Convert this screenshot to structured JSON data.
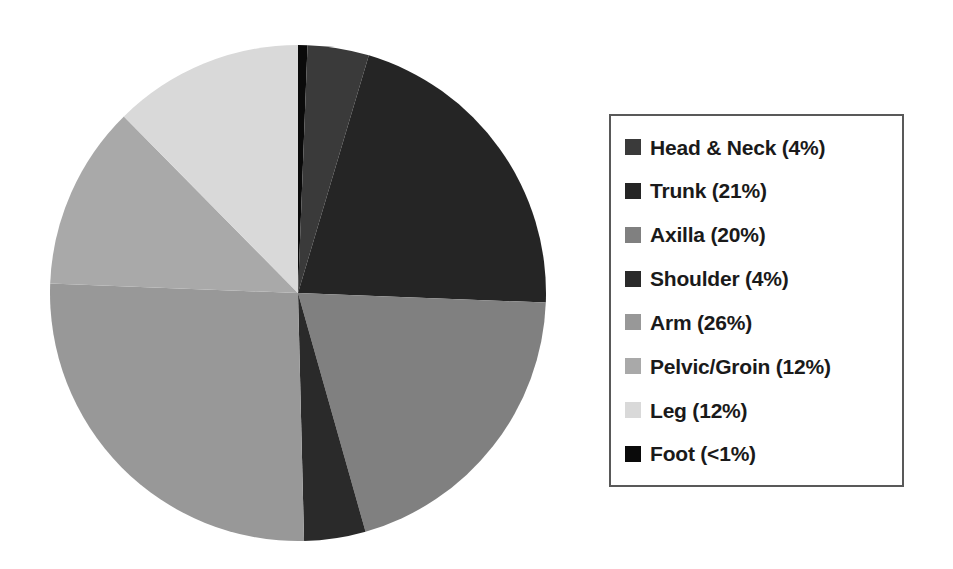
{
  "chart_data": {
    "type": "pie",
    "title": "",
    "subtitle": "",
    "xlabel": "",
    "ylabel": "",
    "grid": false,
    "legend_position": "right",
    "start_angle_deg": 0,
    "direction": "clockwise",
    "categories": [
      "Head & Neck",
      "Trunk",
      "Axilla",
      "Shoulder",
      "Arm",
      "Pelvic/Groin",
      "Leg",
      "Foot"
    ],
    "values": [
      4,
      21,
      20,
      4,
      26,
      12,
      12,
      0.6
    ],
    "value_labels": [
      "4%",
      "21%",
      "20%",
      "4%",
      "26%",
      "12%",
      "12%",
      "<1%"
    ],
    "colors": [
      "#3a3a3a",
      "#252525",
      "#808080",
      "#2a2a2a",
      "#989898",
      "#a9a9a9",
      "#d9d9d9",
      "#0a0a0a"
    ],
    "slice_draw_order": [
      "Foot",
      "Head & Neck",
      "Trunk",
      "Axilla",
      "Shoulder",
      "Arm",
      "Pelvic/Groin",
      "Leg"
    ],
    "slices": [
      {
        "name": "Foot",
        "value": 0.6,
        "label": "Foot (<1%)",
        "color": "#0a0a0a",
        "start_deg": 0.0,
        "sweep_deg": 2.2
      },
      {
        "name": "Head & Neck",
        "value": 4,
        "label": "Head & Neck (4%)",
        "color": "#3a3a3a",
        "start_deg": 2.2,
        "sweep_deg": 14.4
      },
      {
        "name": "Trunk",
        "value": 21,
        "label": "Trunk (21%)",
        "color": "#252525",
        "start_deg": 16.6,
        "sweep_deg": 75.6
      },
      {
        "name": "Axilla",
        "value": 20,
        "label": "Axilla (20%)",
        "color": "#808080",
        "start_deg": 92.2,
        "sweep_deg": 72.0
      },
      {
        "name": "Shoulder",
        "value": 4,
        "label": "Shoulder (4%)",
        "color": "#2a2a2a",
        "start_deg": 164.2,
        "sweep_deg": 14.4
      },
      {
        "name": "Arm",
        "value": 26,
        "label": "Arm (26%)",
        "color": "#989898",
        "start_deg": 178.6,
        "sweep_deg": 93.6
      },
      {
        "name": "Pelvic/Groin",
        "value": 12,
        "label": "Pelvic/Groin (12%)",
        "color": "#a9a9a9",
        "start_deg": 272.2,
        "sweep_deg": 43.2
      },
      {
        "name": "Leg",
        "value": 12,
        "label": "Leg (12%)",
        "color": "#d9d9d9",
        "start_deg": 315.4,
        "sweep_deg": 44.6
      }
    ]
  },
  "legend": {
    "border_color": "#595959",
    "items": [
      {
        "label": "Head & Neck (4%)",
        "color": "#3a3a3a",
        "icon": "square-swatch-icon"
      },
      {
        "label": "Trunk (21%)",
        "color": "#252525",
        "icon": "square-swatch-icon"
      },
      {
        "label": "Axilla (20%)",
        "color": "#808080",
        "icon": "square-swatch-icon"
      },
      {
        "label": "Shoulder (4%)",
        "color": "#2a2a2a",
        "icon": "square-swatch-icon"
      },
      {
        "label": "Arm (26%)",
        "color": "#989898",
        "icon": "square-swatch-icon"
      },
      {
        "label": "Pelvic/Groin (12%)",
        "color": "#a9a9a9",
        "icon": "square-swatch-icon"
      },
      {
        "label": "Leg (12%)",
        "color": "#d9d9d9",
        "icon": "square-swatch-icon"
      },
      {
        "label": "Foot (<1%)",
        "color": "#0a0a0a",
        "icon": "square-swatch-icon"
      }
    ]
  }
}
